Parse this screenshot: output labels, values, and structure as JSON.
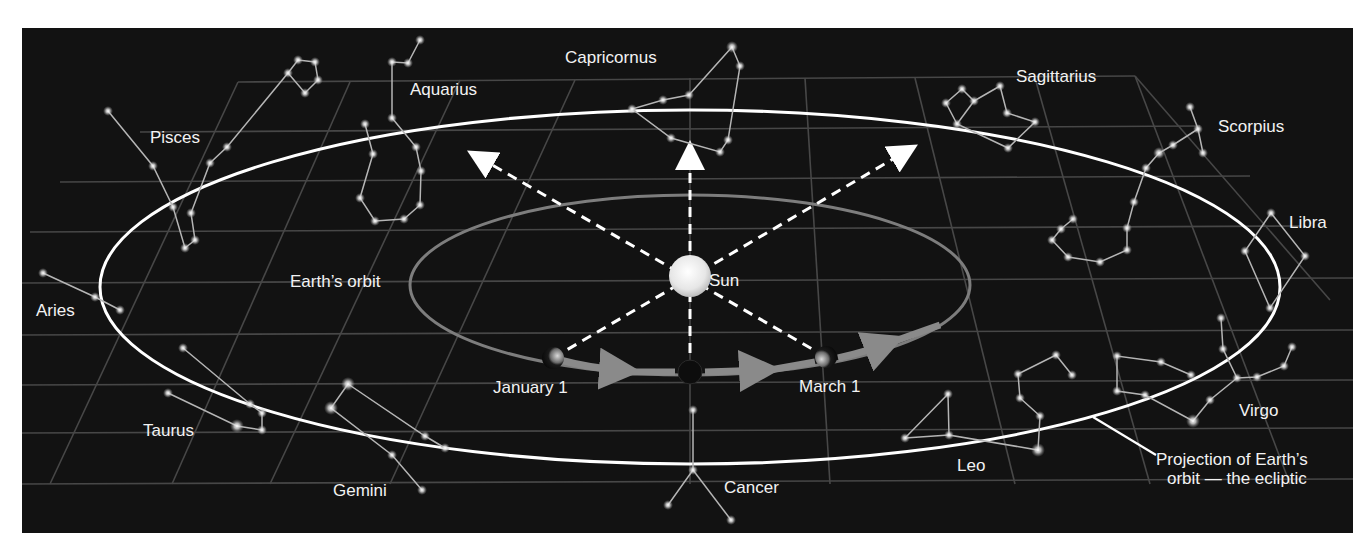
{
  "diagram": {
    "type": "zodiac-ecliptic",
    "colors": {
      "sky": "#121212",
      "grid": "#4a4a4a",
      "ecliptic": "#ffffff",
      "earth_orbit": "#7a7a7a",
      "star": "#e8e8e8",
      "constellation_line": "#bdbdbd",
      "text": "#f2f2f2"
    },
    "center_labels": {
      "sun": "Sun",
      "earth_orbit": "Earth’s orbit",
      "january": "January 1",
      "march": "March 1"
    },
    "ecliptic_label": {
      "line1": "Projection of Earth’s",
      "line2": "orbit — the ecliptic"
    },
    "constellations": [
      {
        "name": "Capricornus"
      },
      {
        "name": "Aquarius"
      },
      {
        "name": "Pisces"
      },
      {
        "name": "Aries"
      },
      {
        "name": "Taurus"
      },
      {
        "name": "Gemini"
      },
      {
        "name": "Cancer"
      },
      {
        "name": "Leo"
      },
      {
        "name": "Virgo"
      },
      {
        "name": "Libra"
      },
      {
        "name": "Scorpius"
      },
      {
        "name": "Sagittarius"
      }
    ]
  }
}
